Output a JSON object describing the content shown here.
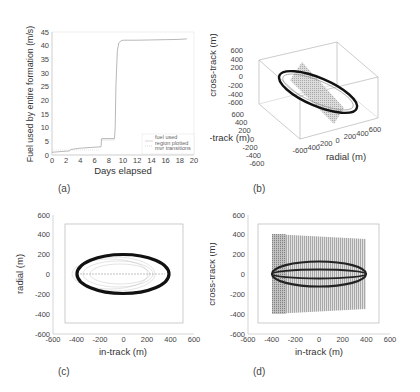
{
  "figure": {
    "panels": [
      "(a)",
      "(b)",
      "(c)",
      "(d)"
    ]
  },
  "chart_data": [
    {
      "panel": "(a)",
      "type": "line",
      "title": "",
      "xlabel": "Days elapsed",
      "ylabel": "Fuel used by entire formation (m/s)",
      "xlim": [
        0,
        20
      ],
      "ylim": [
        0,
        45
      ],
      "xticks": [
        "0",
        "2",
        "4",
        "6",
        "8",
        "10",
        "12",
        "14",
        "16",
        "18",
        "20"
      ],
      "yticks": [
        "0",
        "5",
        "10",
        "15",
        "20",
        "25",
        "30",
        "35",
        "40",
        "45"
      ],
      "grid": false,
      "legend": {
        "position": "lower right",
        "entries": [
          "fuel used",
          "region plotted",
          "mvr transitions"
        ]
      },
      "series": [
        {
          "name": "fuel used",
          "x": [
            0,
            2.5,
            2.6,
            4,
            6.9,
            7.0,
            8.8,
            8.9,
            9.0,
            9.2,
            9.4,
            9.7,
            10,
            12,
            14,
            16,
            18,
            19
          ],
          "y": [
            1,
            1.5,
            2,
            2.5,
            3,
            6,
            6,
            10,
            25,
            38,
            41,
            41.7,
            42,
            42,
            42.1,
            42.2,
            42.3,
            42.5
          ]
        }
      ]
    },
    {
      "panel": "(b)",
      "type": "scatter",
      "title": "",
      "xlabel": "radial (m)",
      "ylabel": "in-track (m)",
      "zlabel": "cross-track (m)",
      "xticks": [
        "-600",
        "-400",
        "-200",
        "0",
        "200",
        "400",
        "600"
      ],
      "yticks": [
        "-600",
        "-400",
        "-200",
        "0",
        "200",
        "400",
        "600"
      ],
      "zticks": [
        "-600",
        "-400",
        "-200",
        "0",
        "200",
        "400",
        "600"
      ],
      "description": "3D view of formation relative orbits: dense ellipse tilted through box with shaded planar region"
    },
    {
      "panel": "(c)",
      "type": "scatter",
      "title": "",
      "xlabel": "in-track (m)",
      "ylabel": "radial (m)",
      "xlim": [
        -600,
        600
      ],
      "ylim": [
        -600,
        600
      ],
      "xticks": [
        "-600",
        "-400",
        "-200",
        "0",
        "200",
        "400",
        "600"
      ],
      "yticks": [
        "-600",
        "-400",
        "-200",
        "0",
        "200",
        "400",
        "600"
      ],
      "ellipse": {
        "center": [
          0,
          0
        ],
        "semi_axis_x": 400,
        "semi_axis_y": 200
      }
    },
    {
      "panel": "(d)",
      "type": "scatter",
      "title": "",
      "xlabel": "in-track (m)",
      "ylabel": "cross-track (m)",
      "xlim": [
        -600,
        600
      ],
      "ylim": [
        -600,
        600
      ],
      "xticks": [
        "-600",
        "-400",
        "-200",
        "0",
        "200",
        "400",
        "600"
      ],
      "yticks": [
        "-600",
        "-400",
        "-200",
        "0",
        "200",
        "400",
        "600"
      ],
      "shaded_region": {
        "x": [
          -400,
          400
        ],
        "y_left": [
          -400,
          400
        ],
        "y_right": [
          -350,
          350
        ]
      },
      "ellipses": [
        {
          "center": [
            0,
            0
          ],
          "semi_axis_x": 400,
          "semi_axis_y": 110
        },
        {
          "center": [
            0,
            0
          ],
          "semi_axis_x": 400,
          "semi_axis_y": 40
        }
      ]
    }
  ],
  "labels": {
    "a": {
      "panel": "(a)",
      "xlabel": "Days elapsed",
      "ylabel": "Fuel used by entire formation (m/s)",
      "legend": [
        "fuel used",
        "region plotted",
        "mvr transitions"
      ]
    },
    "b": {
      "panel": "(b)",
      "xlabel": "radial (m)",
      "ylabel": "in-track (m)",
      "zlabel": "cross-track (m)"
    },
    "c": {
      "panel": "(c)",
      "xlabel": "in-track (m)",
      "ylabel": "radial (m)"
    },
    "d": {
      "panel": "(d)",
      "xlabel": "in-track (m)",
      "ylabel": "cross-track (m)"
    }
  }
}
